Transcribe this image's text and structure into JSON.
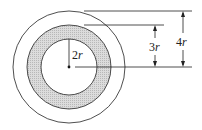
{
  "diagram": {
    "center": {
      "x": 69,
      "y": 67
    },
    "circles": [
      {
        "name": "outer-circle",
        "radius_label": "4r",
        "radius_px": 56,
        "fill": "#ffffff"
      },
      {
        "name": "shaded-ring-outer",
        "radius_label": "3r",
        "radius_px": 42,
        "fill": "#d4d4d4"
      },
      {
        "name": "inner-circle",
        "radius_label": "2r",
        "radius_px": 28,
        "fill": "#ffffff"
      }
    ],
    "labels": {
      "inner_radius": {
        "num": "2",
        "var": "r"
      },
      "middle_radius": {
        "num": "3",
        "var": "r"
      },
      "outer_radius": {
        "num": "4",
        "var": "r"
      }
    },
    "colors": {
      "stroke": "#222222",
      "shade": "#d4d4d4",
      "background": "#ffffff"
    }
  }
}
